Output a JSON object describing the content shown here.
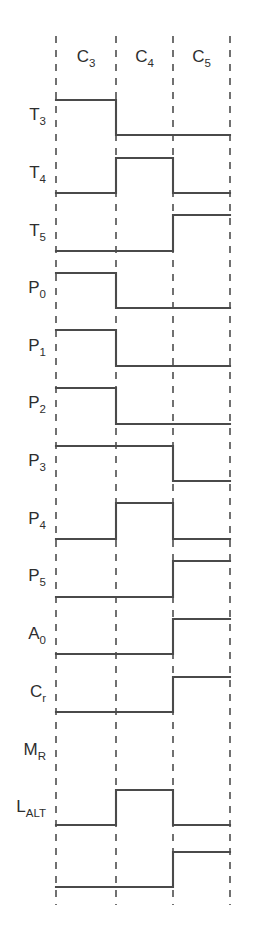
{
  "figure": {
    "type": "timing-diagram",
    "title": "",
    "line_color": "#4a4a4a",
    "gridline_color": "#4e4e4e",
    "background": "#ffffff",
    "levels": {
      "high": 1,
      "low": 0
    }
  },
  "clocks": {
    "label_row_y": 62,
    "items": [
      {
        "base": "C",
        "sub": "3",
        "text": "C3"
      },
      {
        "base": "C",
        "sub": "4",
        "text": "C4"
      },
      {
        "base": "C",
        "sub": "5",
        "text": "C5"
      }
    ]
  },
  "axis": {
    "boundaries_x": [
      56,
      116,
      173,
      230
    ],
    "grid_top_y": 36,
    "grid_bottom_y": 905,
    "intervals": [
      "C3",
      "C4",
      "C5"
    ]
  },
  "chart_data": {
    "type": "timing",
    "title": "",
    "xlabel": "",
    "ylabel": "",
    "categories": [
      "C3",
      "C4",
      "C5"
    ],
    "series": [
      {
        "name": "T3",
        "base": "T",
        "sub": "3",
        "values": [
          1,
          0,
          0
        ],
        "high_y": 100,
        "low_y": 135
      },
      {
        "name": "T4",
        "base": "T",
        "sub": "4",
        "values": [
          0,
          1,
          0
        ],
        "high_y": 158,
        "low_y": 193
      },
      {
        "name": "T5",
        "base": "T",
        "sub": "5",
        "values": [
          0,
          0,
          1
        ],
        "high_y": 215,
        "low_y": 251
      },
      {
        "name": "P0",
        "base": "P",
        "sub": "0",
        "values": [
          1,
          0,
          0
        ],
        "high_y": 273,
        "low_y": 308
      },
      {
        "name": "P1",
        "base": "P",
        "sub": "1",
        "values": [
          1,
          0,
          0
        ],
        "high_y": 330,
        "low_y": 366
      },
      {
        "name": "P2",
        "base": "P",
        "sub": "2",
        "values": [
          1,
          0,
          0
        ],
        "high_y": 388,
        "low_y": 424
      },
      {
        "name": "P3",
        "base": "P",
        "sub": "3",
        "values": [
          1,
          1,
          0
        ],
        "high_y": 446,
        "low_y": 481
      },
      {
        "name": "P4",
        "base": "P",
        "sub": "4",
        "values": [
          0,
          1,
          0
        ],
        "high_y": 503,
        "low_y": 539
      },
      {
        "name": "P5",
        "base": "P",
        "sub": "5",
        "values": [
          0,
          0,
          1
        ],
        "high_y": 561,
        "low_y": 597
      },
      {
        "name": "A0",
        "base": "A",
        "sub": "0",
        "values": [
          0,
          0,
          1
        ],
        "high_y": 619,
        "low_y": 654
      },
      {
        "name": "Cr",
        "base": "C",
        "sub": "r",
        "values": [
          0,
          0,
          1
        ],
        "high_y": 677,
        "low_y": 712
      },
      {
        "name": "MR",
        "base": "M",
        "sub": "R",
        "values": [
          0,
          1,
          0
        ],
        "high_y": 790,
        "low_y": 825
      },
      {
        "name": "LALT",
        "base": "L",
        "sub": "ALT",
        "values": [
          0,
          0,
          1
        ],
        "high_y": 852,
        "low_y": 887
      }
    ],
    "label_x": 46,
    "label_offsets_y": [
      120,
      178,
      236,
      293,
      351,
      408,
      466,
      524,
      581,
      639,
      697,
      755,
      812
    ],
    "grid_on": true,
    "legend": "none"
  }
}
